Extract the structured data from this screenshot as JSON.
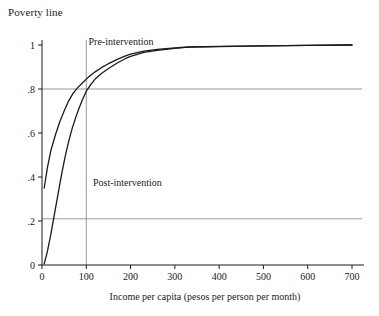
{
  "chart_data": {
    "type": "line",
    "title": "Poverty line",
    "xlabel": "Income per capita (pesos per person per month)",
    "ylabel": "",
    "xlim": [
      0,
      700
    ],
    "ylim": [
      0,
      1.05
    ],
    "xticks": [
      0,
      100,
      200,
      300,
      400,
      500,
      600,
      700
    ],
    "xtick_labels": [
      "0",
      "100",
      "200",
      "300",
      "400",
      "500",
      "600",
      "700"
    ],
    "yticks": [
      0,
      0.2,
      0.4,
      0.6,
      0.8,
      1
    ],
    "ytick_labels": [
      "0",
      ".2",
      ".4",
      ".6",
      ".8",
      "1"
    ],
    "grid": false,
    "reference_lines": [
      {
        "name": "poverty-line-vertical",
        "orientation": "vertical",
        "value": 100
      },
      {
        "name": "horizontal-upper",
        "orientation": "horizontal",
        "value": 0.8
      },
      {
        "name": "horizontal-lower",
        "orientation": "horizontal",
        "value": 0.21
      }
    ],
    "annotations": [
      {
        "name": "pre-intervention-label",
        "text": "Pre-intervention",
        "x": 105,
        "y": 1.0
      },
      {
        "name": "post-intervention-label",
        "text": "Post-intervention",
        "x": 115,
        "y": 0.36
      }
    ],
    "series": [
      {
        "name": "Pre-intervention",
        "points": [
          [
            5,
            0.35
          ],
          [
            12,
            0.44
          ],
          [
            20,
            0.52
          ],
          [
            30,
            0.59
          ],
          [
            40,
            0.65
          ],
          [
            50,
            0.7
          ],
          [
            60,
            0.745
          ],
          [
            70,
            0.78
          ],
          [
            80,
            0.805
          ],
          [
            90,
            0.825
          ],
          [
            100,
            0.845
          ],
          [
            110,
            0.862
          ],
          [
            120,
            0.878
          ],
          [
            135,
            0.898
          ],
          [
            150,
            0.915
          ],
          [
            170,
            0.935
          ],
          [
            190,
            0.952
          ],
          [
            200,
            0.958
          ],
          [
            230,
            0.972
          ],
          [
            260,
            0.98
          ],
          [
            300,
            0.987
          ],
          [
            330,
            0.991
          ],
          [
            400,
            0.994
          ],
          [
            500,
            0.996
          ],
          [
            600,
            0.998
          ],
          [
            700,
            1.0
          ]
        ]
      },
      {
        "name": "Post-intervention",
        "points": [
          [
            5,
            0.005
          ],
          [
            12,
            0.06
          ],
          [
            20,
            0.14
          ],
          [
            28,
            0.23
          ],
          [
            36,
            0.32
          ],
          [
            44,
            0.41
          ],
          [
            52,
            0.49
          ],
          [
            60,
            0.56
          ],
          [
            68,
            0.62
          ],
          [
            76,
            0.67
          ],
          [
            84,
            0.715
          ],
          [
            92,
            0.755
          ],
          [
            100,
            0.79
          ],
          [
            110,
            0.82
          ],
          [
            120,
            0.845
          ],
          [
            135,
            0.872
          ],
          [
            150,
            0.893
          ],
          [
            170,
            0.918
          ],
          [
            190,
            0.94
          ],
          [
            200,
            0.948
          ],
          [
            230,
            0.966
          ],
          [
            260,
            0.976
          ],
          [
            300,
            0.985
          ],
          [
            330,
            0.99
          ],
          [
            400,
            0.993
          ],
          [
            500,
            0.996
          ],
          [
            600,
            0.998
          ],
          [
            700,
            1.0
          ]
        ]
      }
    ]
  }
}
